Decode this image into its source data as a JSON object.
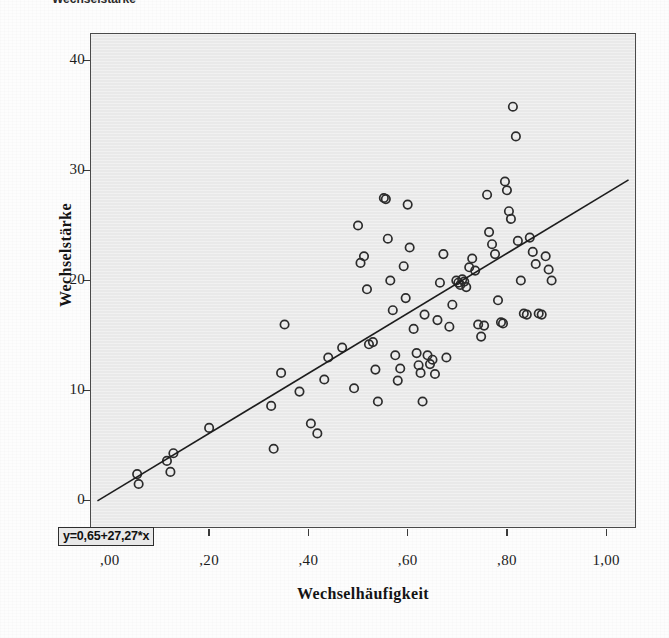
{
  "caption": {
    "text": "Wechselstärke"
  },
  "axis_titles": {
    "y": "Wechselstärke",
    "x": "Wechselhäufigkeit"
  },
  "annotation": {
    "equation": "y=0,65+27,27*x"
  },
  "colors": {
    "panel_fill": "#e9e9e9",
    "panel_border": "#4a4a4a",
    "marker_stroke": "#2c2c2c",
    "line_stroke": "#1d1d1d",
    "text": "#141414"
  },
  "chart_data": {
    "type": "scatter",
    "title": "",
    "xlabel": "Wechselhäufigkeit",
    "ylabel": "Wechselstärke",
    "xlim": [
      -0.04,
      1.06
    ],
    "ylim": [
      -2.5,
      42.5
    ],
    "xticks": [
      0.0,
      0.2,
      0.4,
      0.6,
      0.8,
      1.0
    ],
    "xtick_labels": [
      ",00",
      ",20",
      ",40",
      ",60",
      ",80",
      "1,00"
    ],
    "yticks": [
      0,
      10,
      20,
      30,
      40
    ],
    "ytick_labels": [
      "0",
      "10",
      "20",
      "30",
      "40"
    ],
    "grid": false,
    "legend": null,
    "marker": "open-circle",
    "annotations": [
      {
        "text": "y=0,65+27,27*x",
        "x": 0.0,
        "y": 0.0,
        "boxed": true
      }
    ],
    "series": [
      {
        "name": "Regressionsgerade",
        "type": "line",
        "equation": "y = 0,65 + 27,27*x",
        "intercept": 0.65,
        "slope": 27.27,
        "x": [
          -0.025,
          1.045
        ],
        "y": [
          -0.03,
          29.15
        ]
      },
      {
        "name": "Beobachtungen",
        "type": "scatter",
        "points": [
          [
            0.055,
            2.4
          ],
          [
            0.058,
            1.5
          ],
          [
            0.115,
            3.6
          ],
          [
            0.122,
            2.6
          ],
          [
            0.128,
            4.3
          ],
          [
            0.2,
            6.6
          ],
          [
            0.325,
            8.6
          ],
          [
            0.33,
            4.7
          ],
          [
            0.345,
            11.6
          ],
          [
            0.352,
            16.0
          ],
          [
            0.382,
            9.9
          ],
          [
            0.405,
            7.0
          ],
          [
            0.418,
            6.1
          ],
          [
            0.432,
            11.0
          ],
          [
            0.44,
            13.0
          ],
          [
            0.468,
            13.9
          ],
          [
            0.492,
            10.2
          ],
          [
            0.5,
            25.0
          ],
          [
            0.505,
            21.6
          ],
          [
            0.512,
            22.2
          ],
          [
            0.518,
            19.2
          ],
          [
            0.522,
            14.2
          ],
          [
            0.53,
            14.4
          ],
          [
            0.535,
            11.9
          ],
          [
            0.54,
            9.0
          ],
          [
            0.552,
            27.5
          ],
          [
            0.556,
            27.4
          ],
          [
            0.56,
            23.8
          ],
          [
            0.565,
            20.0
          ],
          [
            0.57,
            17.3
          ],
          [
            0.575,
            13.2
          ],
          [
            0.58,
            10.9
          ],
          [
            0.585,
            12.0
          ],
          [
            0.592,
            21.3
          ],
          [
            0.596,
            18.4
          ],
          [
            0.6,
            26.9
          ],
          [
            0.604,
            23.0
          ],
          [
            0.612,
            15.6
          ],
          [
            0.618,
            13.4
          ],
          [
            0.622,
            12.3
          ],
          [
            0.626,
            11.6
          ],
          [
            0.63,
            9.0
          ],
          [
            0.634,
            16.9
          ],
          [
            0.64,
            13.2
          ],
          [
            0.645,
            12.4
          ],
          [
            0.65,
            12.8
          ],
          [
            0.655,
            11.5
          ],
          [
            0.66,
            16.4
          ],
          [
            0.665,
            19.8
          ],
          [
            0.672,
            22.4
          ],
          [
            0.678,
            13.0
          ],
          [
            0.684,
            15.8
          ],
          [
            0.69,
            17.8
          ],
          [
            0.698,
            20.0
          ],
          [
            0.702,
            19.8
          ],
          [
            0.706,
            19.6
          ],
          [
            0.71,
            20.1
          ],
          [
            0.714,
            19.9
          ],
          [
            0.718,
            19.4
          ],
          [
            0.724,
            21.2
          ],
          [
            0.73,
            22.0
          ],
          [
            0.736,
            20.9
          ],
          [
            0.742,
            16.0
          ],
          [
            0.748,
            14.9
          ],
          [
            0.754,
            15.9
          ],
          [
            0.76,
            27.8
          ],
          [
            0.764,
            24.4
          ],
          [
            0.77,
            23.3
          ],
          [
            0.776,
            22.4
          ],
          [
            0.782,
            18.2
          ],
          [
            0.788,
            16.2
          ],
          [
            0.792,
            16.1
          ],
          [
            0.796,
            29.0
          ],
          [
            0.8,
            28.2
          ],
          [
            0.804,
            26.3
          ],
          [
            0.808,
            25.6
          ],
          [
            0.812,
            35.8
          ],
          [
            0.818,
            33.1
          ],
          [
            0.822,
            23.6
          ],
          [
            0.828,
            20.0
          ],
          [
            0.834,
            17.0
          ],
          [
            0.84,
            16.9
          ],
          [
            0.846,
            23.9
          ],
          [
            0.852,
            22.6
          ],
          [
            0.858,
            21.5
          ],
          [
            0.864,
            17.0
          ],
          [
            0.87,
            16.9
          ],
          [
            0.878,
            22.2
          ],
          [
            0.884,
            21.0
          ],
          [
            0.89,
            20.0
          ]
        ]
      }
    ]
  }
}
